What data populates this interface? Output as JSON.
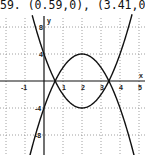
{
  "caption": "59. (0.59,0), (3.41,0)",
  "chart_data": {
    "type": "line",
    "title": "59. (0.59,0), (3.41,0)",
    "xlabel": "x",
    "ylabel": "y",
    "xlim": [
      -2.3,
      5
    ],
    "ylim": [
      -11,
      11
    ],
    "grid": true,
    "x_ticks": [
      "-1",
      "1",
      "2",
      "3",
      "4",
      "5"
    ],
    "y_ticks": [
      "8",
      "4",
      "-4",
      "-8"
    ],
    "series": [
      {
        "name": "y = 2x^2 - 8x + 4",
        "shape": "upward parabola",
        "vertex": [
          2,
          -4
        ],
        "y_intercept": 4,
        "roots": [
          0.59,
          3.41
        ]
      },
      {
        "name": "y = -2x^2 + 8x - 4",
        "shape": "downward parabola",
        "vertex": [
          2,
          4
        ],
        "y_intercept": -4,
        "roots": [
          0.59,
          3.41
        ]
      }
    ],
    "intersections": [
      [
        0.59,
        0
      ],
      [
        3.41,
        0
      ]
    ]
  },
  "axis": {
    "x_label": "x",
    "y_label": "y"
  }
}
